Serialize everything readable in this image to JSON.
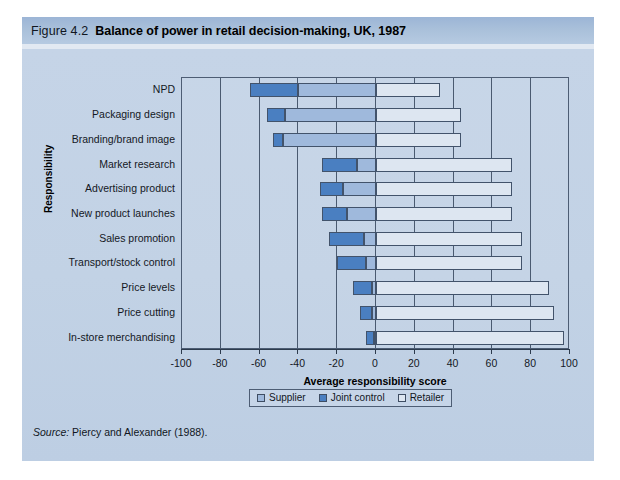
{
  "figure": {
    "number": "Figure 4.2",
    "title": "Balance of power in retail decision-making, UK, 1987",
    "source": "Source: Piercy and Alexander (1988)."
  },
  "source_prefix": "Source:",
  "source_rest": " Piercy and Alexander (1988).",
  "legend": {
    "position": "below-axis",
    "items": [
      {
        "label": "Supplier",
        "color": "#9fb9dc"
      },
      {
        "label": "Joint control",
        "color": "#4a7fc1"
      },
      {
        "label": "Retailer",
        "color": "#dde6f1"
      }
    ]
  },
  "chart_data": {
    "type": "bar",
    "orientation": "horizontal",
    "stacked": true,
    "title": "Balance of power in retail decision-making, UK, 1987",
    "xlabel": "Average responsibility score",
    "ylabel": "Responsibility",
    "xlim": [
      -100,
      100
    ],
    "xticks": [
      -100,
      -80,
      -60,
      -40,
      -20,
      0,
      20,
      40,
      60,
      80,
      100
    ],
    "xticklabels": [
      "-100",
      "-80",
      "-60",
      "-40",
      "-20",
      "0",
      "20",
      "40",
      "60",
      "80",
      "100"
    ],
    "grid": true,
    "grid_axis": "x",
    "categories": [
      "NPD",
      "Packaging design",
      "Branding/brand image",
      "Market research",
      "Advertising product",
      "New product launches",
      "Sales promotion",
      "Transport/stock control",
      "Price levels",
      "Price cutting",
      "In-store merchandising"
    ],
    "series": [
      {
        "name": "Supplier",
        "color": "#9fb9dc",
        "values": [
          -40,
          -47,
          -48,
          -10,
          -17,
          -15,
          -6,
          -5,
          -2,
          -2,
          -1
        ]
      },
      {
        "name": "Joint control",
        "color": "#4a7fc1",
        "values": [
          -25,
          -9,
          -5,
          -18,
          -12,
          -13,
          -18,
          -15,
          -10,
          -6,
          -4
        ]
      },
      {
        "name": "Retailer",
        "color": "#dde6f1",
        "values": [
          33,
          44,
          44,
          70,
          70,
          70,
          75,
          75,
          89,
          92,
          97
        ]
      }
    ],
    "segment_spans": [
      {
        "category": "NPD",
        "joint": [
          -65,
          -40
        ],
        "supplier": [
          -40,
          0
        ],
        "retailer": [
          0,
          33
        ]
      },
      {
        "category": "Packaging design",
        "joint": [
          -56,
          -47
        ],
        "supplier": [
          -47,
          0
        ],
        "retailer": [
          0,
          44
        ]
      },
      {
        "category": "Branding/brand image",
        "joint": [
          -53,
          -48
        ],
        "supplier": [
          -48,
          0
        ],
        "retailer": [
          0,
          44
        ]
      },
      {
        "category": "Market research",
        "joint": [
          -28,
          -10
        ],
        "supplier": [
          -10,
          0
        ],
        "retailer": [
          0,
          70
        ]
      },
      {
        "category": "Advertising product",
        "joint": [
          -29,
          -17
        ],
        "supplier": [
          -17,
          0
        ],
        "retailer": [
          0,
          70
        ]
      },
      {
        "category": "New product launches",
        "joint": [
          -28,
          -15
        ],
        "supplier": [
          -15,
          0
        ],
        "retailer": [
          0,
          70
        ]
      },
      {
        "category": "Sales promotion",
        "joint": [
          -24,
          -6
        ],
        "supplier": [
          -6,
          0
        ],
        "retailer": [
          0,
          75
        ]
      },
      {
        "category": "Transport/stock control",
        "joint": [
          -20,
          -5
        ],
        "supplier": [
          -5,
          0
        ],
        "retailer": [
          0,
          75
        ]
      },
      {
        "category": "Price levels",
        "joint": [
          -12,
          -2
        ],
        "supplier": [
          -2,
          0
        ],
        "retailer": [
          0,
          89
        ]
      },
      {
        "category": "Price cutting",
        "joint": [
          -8,
          -2
        ],
        "supplier": [
          -2,
          0
        ],
        "retailer": [
          0,
          92
        ]
      },
      {
        "category": "In-store merchandising",
        "joint": [
          -5,
          -1
        ],
        "supplier": [
          -1,
          0
        ],
        "retailer": [
          0,
          97
        ]
      }
    ]
  }
}
